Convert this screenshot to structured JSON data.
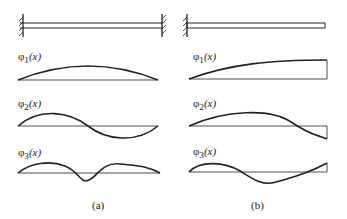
{
  "figure": {
    "panels": [
      {
        "id": "a",
        "caption": "(a)",
        "support": "fixed-fixed",
        "modes": [
          {
            "label_func": "φ",
            "label_sub": "1",
            "label_arg": "(x)"
          },
          {
            "label_func": "φ",
            "label_sub": "2",
            "label_arg": "(x)"
          },
          {
            "label_func": "φ",
            "label_sub": "3",
            "label_arg": "(x)"
          }
        ]
      },
      {
        "id": "b",
        "caption": "(b)",
        "support": "fixed-free (cantilever)",
        "modes": [
          {
            "label_func": "φ",
            "label_sub": "1",
            "label_arg": "(x)"
          },
          {
            "label_func": "φ",
            "label_sub": "2",
            "label_arg": "(x)"
          },
          {
            "label_func": "φ",
            "label_sub": "3",
            "label_arg": "(x)"
          }
        ]
      }
    ],
    "colors": {
      "line": "#222222",
      "background": "#ffffff"
    }
  }
}
